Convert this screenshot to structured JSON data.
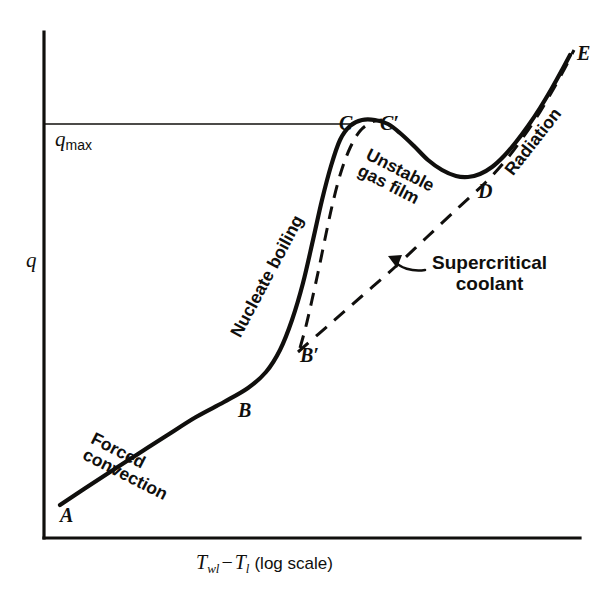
{
  "figure": {
    "kind": "boiling-curve-diagram",
    "background_color": "#ffffff",
    "ink_color": "#100f0d"
  },
  "axes": {
    "y_label": "q",
    "y_threshold_label_base": "q",
    "y_threshold_label_sub": "max",
    "x_label_t_wall": "T",
    "x_label_t_wall_sub": "wl",
    "x_label_minus": "−",
    "x_label_t_liquid": "T",
    "x_label_t_liquid_sub": "l",
    "x_label_scale": "(log scale)",
    "x_axis_full_text": "T_wl − T_l (log scale)",
    "grid": "none",
    "x_scale": "log",
    "tick_labels": []
  },
  "points": [
    {
      "id": "A",
      "label": "A",
      "x": 60,
      "y": 505
    },
    {
      "id": "B",
      "label": "B",
      "x": 238,
      "y": 400
    },
    {
      "id": "Bp",
      "label": "B′",
      "x": 300,
      "y": 345
    },
    {
      "id": "C",
      "label": "C",
      "x": 339,
      "y": 113
    },
    {
      "id": "Cp",
      "label": "C′",
      "x": 380,
      "y": 113
    },
    {
      "id": "D",
      "label": "D",
      "x": 478,
      "y": 181
    },
    {
      "id": "E",
      "label": "E",
      "x": 577,
      "y": 43
    }
  ],
  "curve_notes": [
    {
      "id": "forced-convection",
      "lines": [
        "Forced",
        "convection"
      ],
      "x": 96,
      "y": 430,
      "rotation_deg": 27
    },
    {
      "id": "nucleate-boiling",
      "lines": [
        "Nucleate boiling"
      ],
      "x": 228,
      "y": 332,
      "rotation_deg": -62
    },
    {
      "id": "unstable-gas-film",
      "lines": [
        "Unstable",
        "gas film"
      ],
      "x": 371,
      "y": 146,
      "rotation_deg": 27
    },
    {
      "id": "radiation",
      "lines": [
        "Radiation"
      ],
      "x": 502,
      "y": 168,
      "rotation_deg": -52
    }
  ],
  "callouts": [
    {
      "id": "supercritical-coolant",
      "lines": [
        "Supercritical",
        "coolant"
      ],
      "x": 432,
      "y": 252,
      "arrow_tip": {
        "x": 390,
        "y": 258
      }
    }
  ],
  "chart_data": {
    "type": "line",
    "title": "",
    "xlabel": "T_wl − T_l (log scale)",
    "ylabel": "q",
    "xlim": [
      0,
      615
    ],
    "ylim": [
      0,
      599
    ],
    "grid": false,
    "legend": "none",
    "annotations": [
      "Forced convection",
      "Nucleate boiling",
      "Unstable gas film",
      "Radiation",
      "Supercritical coolant",
      "q_max"
    ],
    "reference_lines": [
      {
        "name": "q_max",
        "orientation": "horizontal",
        "y_px": 124,
        "from_x_px": 44,
        "to_x_px": 352
      }
    ],
    "series": [
      {
        "name": "pool boiling curve (solid)",
        "style": "solid",
        "width": 4.2,
        "points_px": [
          [
            60,
            505
          ],
          [
            84,
            489
          ],
          [
            110,
            472
          ],
          [
            138,
            454
          ],
          [
            166,
            436
          ],
          [
            196,
            417
          ],
          [
            224,
            402
          ],
          [
            248,
            388
          ],
          [
            266,
            372
          ],
          [
            280,
            350
          ],
          [
            292,
            320
          ],
          [
            303,
            283
          ],
          [
            313,
            240
          ],
          [
            322,
            200
          ],
          [
            331,
            166
          ],
          [
            340,
            140
          ],
          [
            350,
            126
          ],
          [
            362,
            120
          ],
          [
            375,
            120
          ],
          [
            388,
            124
          ],
          [
            400,
            133
          ],
          [
            414,
            146
          ],
          [
            428,
            160
          ],
          [
            442,
            170
          ],
          [
            456,
            176
          ],
          [
            468,
            177
          ],
          [
            480,
            174
          ],
          [
            492,
            167
          ],
          [
            504,
            156
          ],
          [
            516,
            142
          ],
          [
            528,
            126
          ],
          [
            540,
            108
          ],
          [
            552,
            88
          ],
          [
            562,
            70
          ],
          [
            570,
            55
          ]
        ]
      },
      {
        "name": "hysteresis branch B' to C' (dashed)",
        "style": "dashed",
        "width": 3.0,
        "points_px": [
          [
            300,
            348
          ],
          [
            306,
            326
          ],
          [
            312,
            300
          ],
          [
            319,
            268
          ],
          [
            326,
            234
          ],
          [
            333,
            202
          ],
          [
            341,
            172
          ],
          [
            350,
            148
          ],
          [
            360,
            131
          ],
          [
            372,
            122
          ],
          [
            382,
            120
          ]
        ]
      },
      {
        "name": "supercritical coolant (dashed)",
        "style": "dashed",
        "width": 3.0,
        "points_px": [
          [
            298,
            352
          ],
          [
            330,
            324
          ],
          [
            362,
            296
          ],
          [
            394,
            268
          ],
          [
            426,
            238
          ],
          [
            458,
            208
          ],
          [
            486,
            182
          ],
          [
            506,
            160
          ],
          [
            524,
            136
          ],
          [
            540,
            112
          ],
          [
            554,
            88
          ],
          [
            566,
            66
          ],
          [
            574,
            50
          ]
        ]
      }
    ],
    "axis_lines": [
      {
        "name": "y-axis",
        "x1_px": 44,
        "y1_px": 32,
        "x2_px": 44,
        "y2_px": 538
      },
      {
        "name": "x-axis",
        "x1_px": 44,
        "y1_px": 538,
        "x2_px": 580,
        "y2_px": 538
      }
    ]
  }
}
